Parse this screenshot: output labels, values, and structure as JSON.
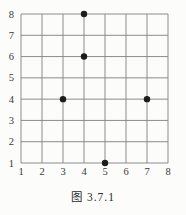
{
  "figure": {
    "caption": "图 3.7.1"
  },
  "chart_data": {
    "type": "scatter",
    "title": "图 3.7.1",
    "points": [
      {
        "x": 4,
        "y": 8
      },
      {
        "x": 4,
        "y": 6
      },
      {
        "x": 3,
        "y": 4
      },
      {
        "x": 7,
        "y": 4
      },
      {
        "x": 5,
        "y": 1
      }
    ],
    "x_ticks": [
      1,
      2,
      3,
      4,
      5,
      6,
      7,
      8
    ],
    "y_ticks": [
      1,
      2,
      3,
      4,
      5,
      6,
      7,
      8
    ],
    "xlim": [
      1,
      8
    ],
    "ylim": [
      1,
      8
    ],
    "grid": true,
    "legend": false,
    "xlabel": "",
    "ylabel": "",
    "colors": {
      "grid_line": "#8c8c8c",
      "point": "#1c1c1c",
      "tick_label": "#3a3a3a",
      "background": "#fcfcfb"
    }
  }
}
